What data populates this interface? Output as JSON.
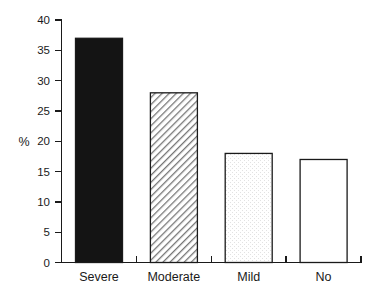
{
  "chart_data": {
    "type": "bar",
    "title": "",
    "subtitle": "",
    "xlabel": "",
    "ylabel": "%",
    "categories": [
      "Severe",
      "Moderate",
      "Mild",
      "No"
    ],
    "values": [
      37,
      28,
      18,
      17
    ],
    "ylim": [
      0,
      40
    ],
    "xlim": [
      0,
      4
    ],
    "yticks": [
      0,
      5,
      10,
      15,
      20,
      25,
      30,
      35,
      40
    ],
    "ytick_labels": [
      "0",
      "5",
      "10",
      "15",
      "20",
      "25",
      "30",
      "35",
      "40"
    ],
    "grid": false,
    "legend": false,
    "legend_position": "none",
    "series": [
      {
        "name": "%",
        "values": [
          37,
          28,
          18,
          17
        ],
        "bar_styles": [
          "solid-black",
          "diagonal-hatch",
          "light-stipple",
          "white-open"
        ]
      }
    ],
    "bar_fill_colors": [
      "#141414",
      "#a8a8a8",
      "#f2f2f2",
      "#ffffff"
    ],
    "outline_color": "#1a1a1a",
    "background_color": "#ffffff"
  },
  "axes": {
    "y_axis_title": "%",
    "y_tick_0": "0",
    "y_tick_1": "5",
    "y_tick_2": "10",
    "y_tick_3": "15",
    "y_tick_4": "20",
    "y_tick_5": "25",
    "y_tick_6": "30",
    "y_tick_7": "35",
    "y_tick_8": "40",
    "x_cat_0": "Severe",
    "x_cat_1": "Moderate",
    "x_cat_2": "Mild",
    "x_cat_3": "No"
  }
}
